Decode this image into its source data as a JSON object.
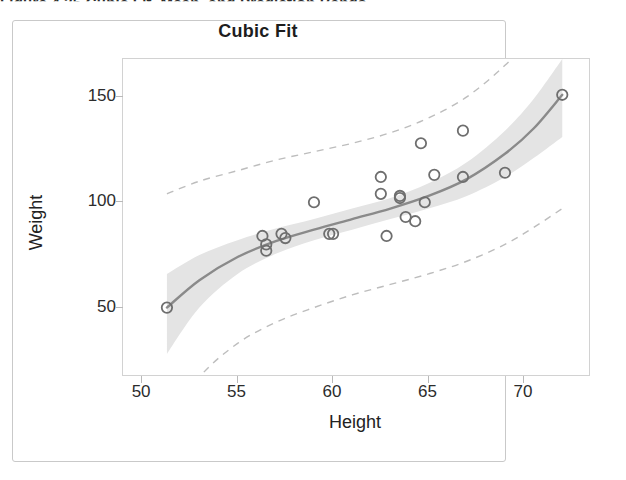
{
  "caption": "Figure 4.35   Cubic Fit, Mean, and Prediction Bands",
  "figure": {
    "title": "Cubic Fit"
  },
  "axes": {
    "x": {
      "label": "Height",
      "ticks": [
        50,
        55,
        60,
        65,
        70
      ],
      "min": 49.0,
      "max": 73.4
    },
    "y": {
      "label": "Weight",
      "ticks": [
        50,
        100,
        150
      ],
      "min": 18.0,
      "max": 168.0
    }
  },
  "colors": {
    "marker_stroke": "#6e6e6e",
    "fit_line": "#8a8a8a",
    "mean_band": "#e4e4e4",
    "prediction_limit": "#bdbdbd",
    "frame": "#d2d2d2",
    "text": "#222222"
  },
  "chart_data": {
    "type": "scatter",
    "title": "Cubic Fit",
    "xlabel": "Height",
    "ylabel": "Weight",
    "xlim": [
      49.0,
      73.4
    ],
    "ylim": [
      18.0,
      168.0
    ],
    "grid": false,
    "legend": null,
    "series": [
      {
        "name": "Observations",
        "marker": "open-circle",
        "x": [
          51.3,
          56.3,
          56.5,
          56.5,
          57.3,
          57.5,
          59.0,
          59.8,
          60.0,
          62.5,
          62.5,
          62.8,
          63.5,
          63.5,
          63.8,
          64.3,
          64.6,
          64.8,
          65.3,
          66.8,
          66.8,
          69.0,
          72.0
        ],
        "y": [
          50.0,
          84.0,
          77.0,
          80.0,
          85.0,
          83.0,
          100.0,
          85.0,
          85.0,
          112.0,
          104.0,
          84.0,
          103.0,
          102.0,
          93.0,
          91.0,
          128.0,
          100.0,
          113.0,
          134.0,
          112.0,
          114.0,
          151.0
        ]
      },
      {
        "name": "Cubic fit",
        "type": "line",
        "style": "solid",
        "x": [
          51.3,
          53.0,
          55.0,
          57.0,
          59.0,
          61.0,
          63.0,
          65.0,
          67.0,
          69.0,
          70.5,
          72.0
        ],
        "y": [
          50.0,
          63.0,
          74.0,
          81.5,
          87.0,
          92.0,
          97.0,
          103.0,
          111.0,
          123.0,
          135.0,
          151.0
        ]
      },
      {
        "name": "95% mean confidence band",
        "type": "band",
        "style": "shaded",
        "x": [
          51.3,
          53.0,
          55.0,
          57.0,
          59.0,
          61.0,
          63.0,
          65.0,
          67.0,
          69.0,
          70.5,
          72.0
        ],
        "lower": [
          28.0,
          50.0,
          66.0,
          75.5,
          82.0,
          87.0,
          92.0,
          97.0,
          103.0,
          112.0,
          121.0,
          131.0
        ],
        "upper": [
          66.0,
          75.0,
          82.0,
          87.5,
          92.0,
          97.0,
          102.0,
          109.0,
          119.0,
          134.0,
          149.0,
          168.0
        ]
      },
      {
        "name": "95% prediction limits",
        "type": "band",
        "style": "dashed",
        "x": [
          51.3,
          53.0,
          55.0,
          57.0,
          59.0,
          61.0,
          63.0,
          65.0,
          67.0,
          69.0,
          70.5,
          72.0
        ],
        "lower": [
          -6.0,
          17.0,
          33.0,
          43.0,
          50.0,
          56.0,
          61.0,
          66.0,
          72.0,
          80.0,
          88.0,
          97.0
        ],
        "upper": [
          104.0,
          110.0,
          115.0,
          120.0,
          124.0,
          128.0,
          133.0,
          140.0,
          150.0,
          165.0,
          180.0,
          200.0
        ]
      }
    ]
  }
}
